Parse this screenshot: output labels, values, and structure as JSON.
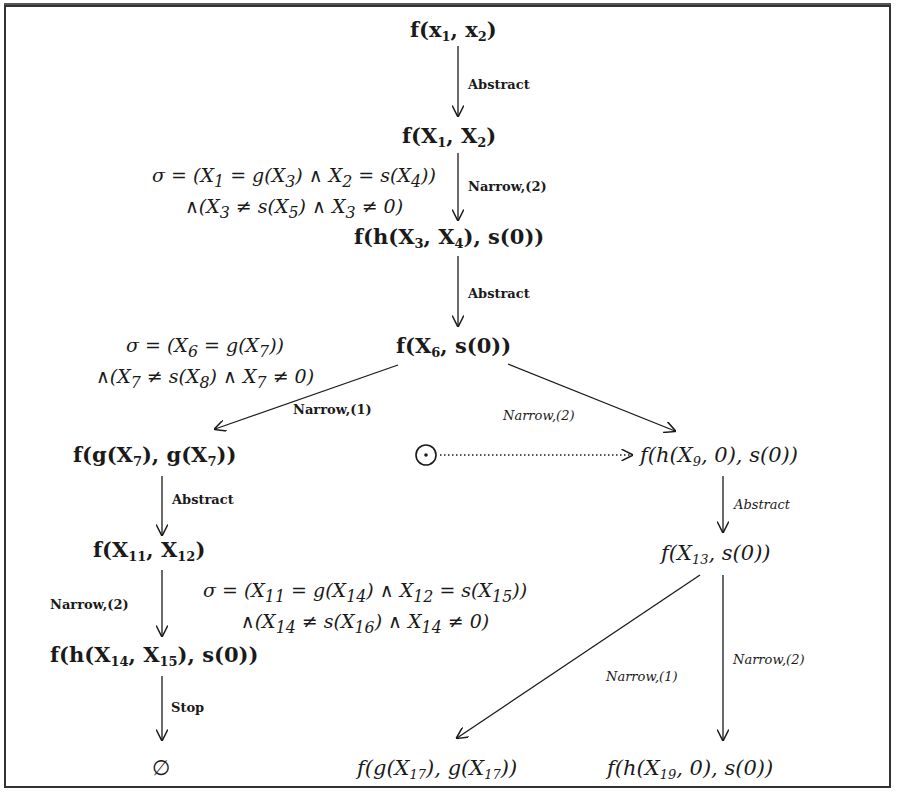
{
  "diagram": {
    "type": "derivation-tree",
    "nodes": [
      {
        "id": "n_root",
        "text": "f(x1, x2)",
        "style": "bold"
      },
      {
        "id": "n_abs1",
        "text": "f(X1, X2)",
        "style": "bold"
      },
      {
        "id": "n_nar1",
        "text": "f(h(X3, X4), s(0))",
        "style": "bold"
      },
      {
        "id": "n_abs2",
        "text": "f(X6, s(0))",
        "style": "bold"
      },
      {
        "id": "n_left1",
        "text": "f(g(X7), g(X7))",
        "style": "bold"
      },
      {
        "id": "n_right1",
        "text": "f(h(X9, 0), s(0))",
        "style": "italic"
      },
      {
        "id": "n_left2",
        "text": "f(X11, X12)",
        "style": "bold"
      },
      {
        "id": "n_right2",
        "text": "f(X13, s(0))",
        "style": "italic"
      },
      {
        "id": "n_left3",
        "text": "f(h(X14, X15), s(0))",
        "style": "bold"
      },
      {
        "id": "n_empty",
        "text": "∅",
        "style": "plain"
      },
      {
        "id": "n_bot1",
        "text": "f(g(X17), g(X17))",
        "style": "italic"
      },
      {
        "id": "n_bot2",
        "text": "f(h(X19, 0), s(0))",
        "style": "italic"
      },
      {
        "id": "n_odot",
        "text": "⊙",
        "style": "symbol"
      }
    ],
    "edges": [
      {
        "from": "n_root",
        "to": "n_abs1",
        "label": "Abstract",
        "style": "bold"
      },
      {
        "from": "n_abs1",
        "to": "n_nar1",
        "label": "Narrow,(2)",
        "style": "bold"
      },
      {
        "from": "n_nar1",
        "to": "n_abs2",
        "label": "Abstract",
        "style": "bold"
      },
      {
        "from": "n_abs2",
        "to": "n_left1",
        "label": "Narrow,(1)",
        "style": "bold"
      },
      {
        "from": "n_abs2",
        "to": "n_right1",
        "label": "Narrow,(2)",
        "style": "italic"
      },
      {
        "from": "n_odot",
        "to": "n_right1",
        "label": "",
        "style": "dotted"
      },
      {
        "from": "n_left1",
        "to": "n_left2",
        "label": "Abstract",
        "style": "bold"
      },
      {
        "from": "n_right1",
        "to": "n_right2",
        "label": "Abstract",
        "style": "italic"
      },
      {
        "from": "n_left2",
        "to": "n_left3",
        "label": "Narrow,(2)",
        "style": "bold"
      },
      {
        "from": "n_left3",
        "to": "n_empty",
        "label": "Stop",
        "style": "bold"
      },
      {
        "from": "n_right2",
        "to": "n_bot1",
        "label": "Narrow,(1)",
        "style": "italic"
      },
      {
        "from": "n_right2",
        "to": "n_bot2",
        "label": "Narrow,(2)",
        "style": "italic"
      }
    ],
    "labels": {
      "abstract": "Abstract",
      "narrow2": "Narrow,(2)",
      "narrow1": "Narrow,(1)",
      "stop": "Stop"
    },
    "constraints": [
      {
        "id": "sigma1",
        "line1": "σ = (X1 = g(X3) ∧ X2 = s(X4))",
        "line2": "∧(X3 ≠ s(X5) ∧ X3 ≠ 0)"
      },
      {
        "id": "sigma2",
        "line1": "σ = (X6 = g(X7))",
        "line2": "∧(X7 ≠ s(X8) ∧ X7 ≠ 0)"
      },
      {
        "id": "sigma3",
        "line1": "σ = (X11 = g(X14) ∧ X12 = s(X15))",
        "line2": "∧(X14 ≠ s(X16) ∧ X14 ≠ 0)"
      }
    ]
  },
  "colors": {
    "ink": "#1a1a1a",
    "border": "#333333",
    "background": "#ffffff",
    "ghost_text": "#e4e4e4"
  }
}
